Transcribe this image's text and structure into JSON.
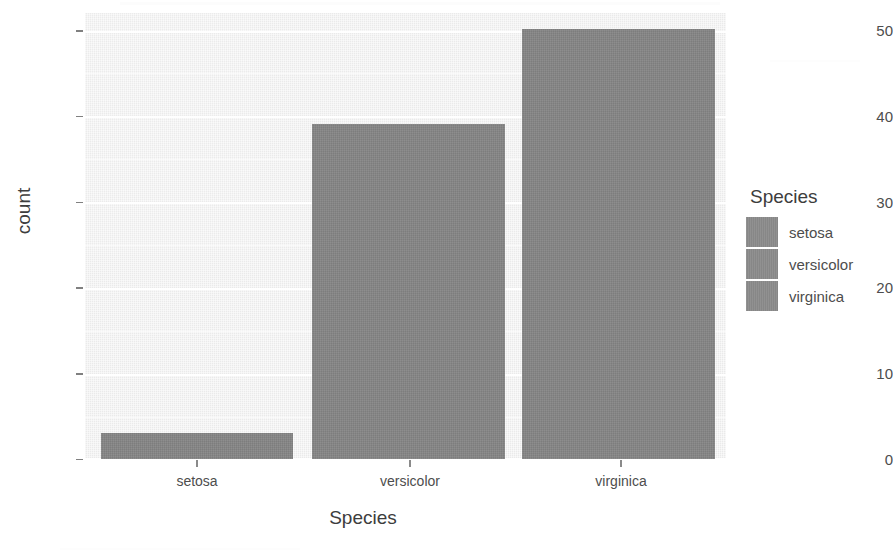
{
  "chart_data": {
    "type": "bar",
    "title": "",
    "categories": [
      "setosa",
      "versicolor",
      "virginica"
    ],
    "values": [
      3,
      39,
      50
    ],
    "series": [
      {
        "name": "count",
        "values": [
          3,
          39,
          50
        ]
      }
    ],
    "xlabel": "Species",
    "ylabel": "count",
    "ylim": [
      0,
      52
    ],
    "yticks": [
      0,
      10,
      20,
      30,
      40,
      50
    ],
    "ytick_labels": [
      "0",
      "10",
      "20",
      "30",
      "40",
      "50"
    ],
    "xtick_labels": [
      "setosa",
      "versicolor",
      "virginica"
    ],
    "grid": true,
    "grid_major": "horizontal-white",
    "grid_minor": true,
    "legend": {
      "title": "Species",
      "position": "right",
      "entries": [
        {
          "label": "setosa",
          "color": "#8b8b8b"
        },
        {
          "label": "versicolor",
          "color": "#8b8b8b"
        },
        {
          "label": "virginica",
          "color": "#8b8b8b"
        }
      ]
    },
    "bar_color": "#848484",
    "panel_background": "#f0f0f0",
    "plot_background": "#ffffff"
  }
}
